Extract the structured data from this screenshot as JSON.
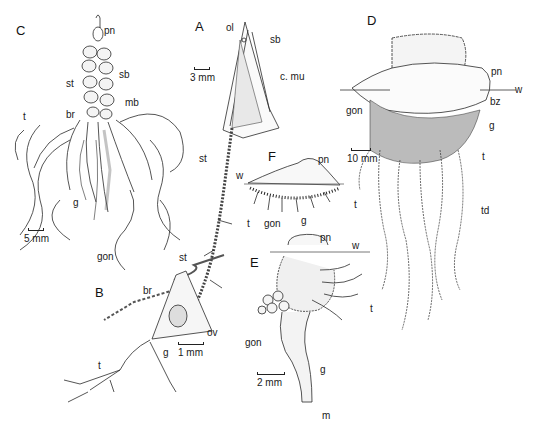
{
  "figure": {
    "panels": [
      {
        "id": "A",
        "labels": [
          "ol",
          "sb",
          "c. mu",
          "st",
          "w",
          "t"
        ],
        "scale_bar": "3 mm"
      },
      {
        "id": "B",
        "labels": [
          "st",
          "br",
          "ov",
          "g",
          "t"
        ],
        "scale_bar": "1 mm"
      },
      {
        "id": "C",
        "labels": [
          "pn",
          "sb",
          "st",
          "mb",
          "br",
          "t",
          "g",
          "gon"
        ],
        "scale_bar": "5 mm"
      },
      {
        "id": "D",
        "labels": [
          "pn",
          "w",
          "bz",
          "gon",
          "g",
          "t",
          "td"
        ],
        "scale_bar": "10 mm"
      },
      {
        "id": "E",
        "labels": [
          "pn",
          "w",
          "t",
          "gon",
          "g",
          "m"
        ],
        "scale_bar": "2 mm"
      },
      {
        "id": "F",
        "labels": [
          "pn",
          "w",
          "gon",
          "g",
          "t"
        ],
        "scale_bar": ""
      }
    ]
  },
  "text": {
    "C": "C",
    "C_pn": "pn",
    "C_sb": "sb",
    "C_st": "st",
    "C_mb": "mb",
    "C_br": "br",
    "C_t": "t",
    "C_g": "g",
    "C_gon": "gon",
    "C_scale": "5 mm",
    "A": "A",
    "A_ol": "ol",
    "A_sb": "sb",
    "A_cmu": "c. mu",
    "A_scale": "3 mm",
    "A_st": "st",
    "A_w": "w",
    "A_t": "t",
    "B": "B",
    "B_st": "st",
    "B_br": "br",
    "B_ov": "ov",
    "B_g": "g",
    "B_t": "t",
    "B_scale": "1 mm",
    "D": "D",
    "D_pn": "pn",
    "D_w": "w",
    "D_bz": "bz",
    "D_gon": "gon",
    "D_g": "g",
    "D_t": "t",
    "D_td": "td",
    "D_scale": "10 mm",
    "F": "F",
    "F_pn": "pn",
    "F_gon": "gon",
    "F_g": "g",
    "F_t": "t",
    "E": "E",
    "E_pn": "pn",
    "E_w": "w",
    "E_t": "t",
    "E_gon": "gon",
    "E_g": "g",
    "E_m": "m",
    "E_scale": "2 mm"
  }
}
